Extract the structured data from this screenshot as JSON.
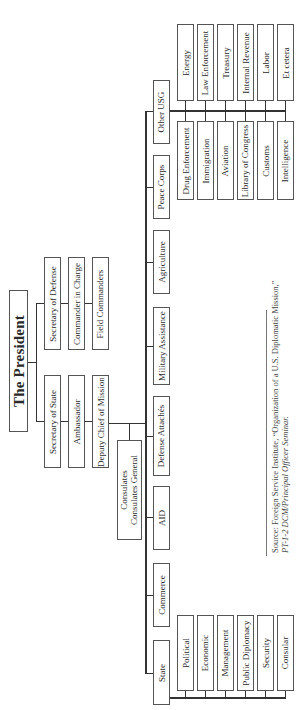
{
  "president": {
    "label": "The President"
  },
  "defense_chain": [
    {
      "label": "Secretary of Defense"
    },
    {
      "label": "Commander in Charge"
    },
    {
      "label": "Field Commanders"
    }
  ],
  "state_chain": [
    {
      "label": "Secretary of State"
    },
    {
      "label": "Ambassador"
    },
    {
      "label": "Deputy Chief of Mission"
    }
  ],
  "consulates": {
    "line1": "Consulates",
    "line2": "Consulates General"
  },
  "agencies": [
    {
      "label": "Other USG"
    },
    {
      "label": "Peace Corps"
    },
    {
      "label": "Agriculture"
    },
    {
      "label": "Military Assistance"
    },
    {
      "label": "Defense Attachés"
    },
    {
      "label": "AID"
    },
    {
      "label": "Commerce"
    },
    {
      "label": "State"
    }
  ],
  "other_usg_top": [
    {
      "label": "Energy"
    },
    {
      "label": "Law Enforcement"
    },
    {
      "label": "Treasury"
    },
    {
      "label": "Internal Revenue"
    },
    {
      "label": "Labor"
    },
    {
      "label": "Et cetera"
    }
  ],
  "other_usg_bottom": [
    {
      "label": "Drug Enforcement"
    },
    {
      "label": "Immigration"
    },
    {
      "label": "Aviation"
    },
    {
      "label": "Library of Congress"
    },
    {
      "label": "Customs"
    },
    {
      "label": "Intelligence"
    }
  ],
  "state_sections": [
    {
      "label": "Political"
    },
    {
      "label": "Economic"
    },
    {
      "label": "Management"
    },
    {
      "label": "Public Diplomacy"
    },
    {
      "label": "Security"
    },
    {
      "label": "Consular"
    }
  ],
  "source": {
    "line1": "Source: Foreign Service Institute, “Organization of a U.S. Diplomatic Mission,”",
    "line2": "PT-1-2 DCM/Principal Officer Seminar."
  }
}
